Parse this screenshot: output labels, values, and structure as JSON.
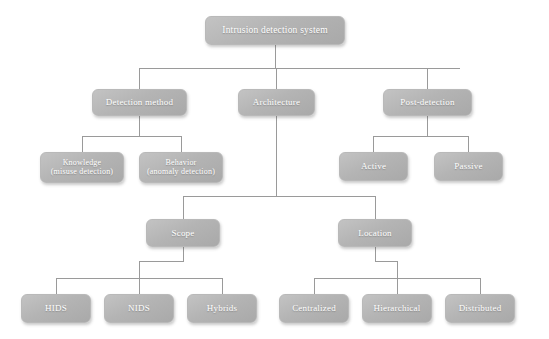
{
  "diagram": {
    "type": "hierarchy-tree",
    "style": {
      "node_fill": "#b4b4b4",
      "node_text_color": "#ffffff",
      "connector_color": "#9a9a9a",
      "background": "#ffffff"
    },
    "nodes": {
      "root": "Intrusion detection system",
      "detection_method": "Detection method",
      "architecture": "Architecture",
      "post_detection": "Post-detection",
      "knowledge": "Knowledge\n(misuse detection)",
      "behavior": "Behavior\n(anomaly detection)",
      "active": "Active",
      "passive": "Passive",
      "scope": "Scope",
      "location": "Location",
      "hids": "HIDS",
      "nids": "NIDS",
      "hybrids": "Hybrids",
      "centralized": "Centralized",
      "hierarchical": "Hierarchical",
      "distributed": "Distributed"
    },
    "edges": [
      {
        "from": "root",
        "to": "detection_method"
      },
      {
        "from": "root",
        "to": "architecture"
      },
      {
        "from": "root",
        "to": "post_detection"
      },
      {
        "from": "detection_method",
        "to": "knowledge"
      },
      {
        "from": "detection_method",
        "to": "behavior"
      },
      {
        "from": "post_detection",
        "to": "active"
      },
      {
        "from": "post_detection",
        "to": "passive"
      },
      {
        "from": "architecture",
        "to": "scope"
      },
      {
        "from": "architecture",
        "to": "location"
      },
      {
        "from": "scope",
        "to": "hids"
      },
      {
        "from": "scope",
        "to": "nids"
      },
      {
        "from": "scope",
        "to": "hybrids"
      },
      {
        "from": "location",
        "to": "centralized"
      },
      {
        "from": "location",
        "to": "hierarchical"
      },
      {
        "from": "location",
        "to": "distributed"
      }
    ]
  }
}
